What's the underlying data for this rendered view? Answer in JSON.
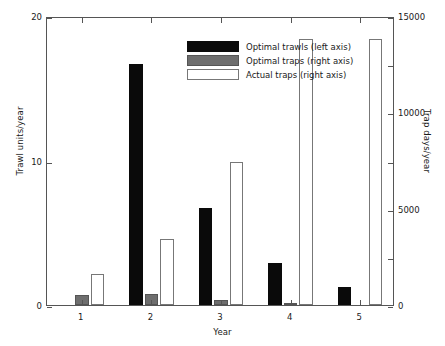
{
  "chart_data": {
    "type": "bar",
    "title": "",
    "xlabel": "Year",
    "ylabel": "Trawl units/year",
    "ylabel_secondary": "Trap days/year",
    "categories": [
      "1",
      "2",
      "3",
      "4",
      "5"
    ],
    "ylim": [
      0,
      20
    ],
    "ylim_secondary": [
      0,
      15000
    ],
    "yticks": [
      "0",
      "10",
      "20"
    ],
    "ytick_values": [
      0,
      10,
      20
    ],
    "yticks_secondary": [
      "0",
      "5000",
      "10000",
      "15000"
    ],
    "ytick_values_secondary": [
      0,
      5000,
      10000,
      15000
    ],
    "grid": false,
    "legend_position": "upper center",
    "series": [
      {
        "name": "Optimal trawls (left axis)",
        "axis": "left",
        "color": "#0a0a0a",
        "units": "Trawl units/year",
        "values": [
          0,
          16.7,
          6.7,
          2.9,
          1.25
        ]
      },
      {
        "name": "Optimal traps (right axis)",
        "axis": "right",
        "color": "#6e6e6e",
        "units": "Trap days/year",
        "values": [
          520,
          550,
          240,
          110,
          0
        ]
      },
      {
        "name": "Actual traps (right axis)",
        "axis": "right",
        "color": "#ffffff",
        "units": "Trap days/year",
        "values": [
          1600,
          3450,
          7400,
          13800,
          13800
        ]
      }
    ]
  },
  "legend": {
    "items": [
      {
        "label": "Optimal trawls (left axis)",
        "swatch": "swatch-trawls"
      },
      {
        "label": "Optimal traps (right axis)",
        "swatch": "swatch-optraps"
      },
      {
        "label": "Actual traps (right axis)",
        "swatch": "swatch-actraps"
      }
    ]
  },
  "axes": {
    "x_title": "Year",
    "y_left_title": "Trawl units/year",
    "y_right_title": "Trap days/year"
  }
}
